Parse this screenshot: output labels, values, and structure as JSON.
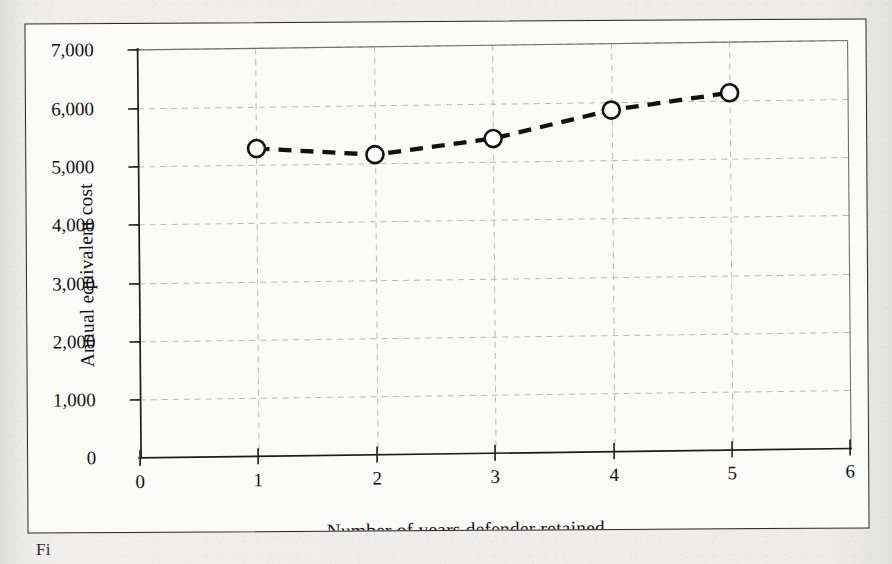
{
  "figure": {
    "background_color": "#ececea",
    "panel_color": "#fbfbfa",
    "border_color": "#2b2b2b",
    "caption": "Fi"
  },
  "chart_data": {
    "type": "line",
    "title": "",
    "subtitle": "",
    "xlabel": "Number of years defender retained",
    "ylabel": "Annual equivalent cost",
    "x": [
      1,
      2,
      3,
      4,
      5
    ],
    "values": [
      5280,
      5150,
      5400,
      5860,
      6130
    ],
    "series": [
      {
        "name": "Annual equivalent cost",
        "x": [
          1,
          2,
          3,
          4,
          5
        ],
        "values": [
          5280,
          5150,
          5400,
          5860,
          6130
        ],
        "line_style": "dashed",
        "line_color": "#111111",
        "marker": "open-circle",
        "marker_fill": "#ffffff",
        "marker_edge": "#111111"
      }
    ],
    "xlim": [
      0,
      6
    ],
    "ylim": [
      0,
      7000
    ],
    "xticks": [
      0,
      1,
      2,
      3,
      4,
      5,
      6
    ],
    "xtick_labels": [
      "0",
      "1",
      "2",
      "3",
      "4",
      "5",
      "6"
    ],
    "yticks": [
      0,
      1000,
      2000,
      3000,
      4000,
      5000,
      6000,
      7000
    ],
    "ytick_labels": [
      "0",
      "1,000",
      "2,000",
      "3,000",
      "4,000",
      "5,000",
      "6,000",
      "7,000"
    ],
    "grid": true,
    "grid_style": "dashed",
    "grid_color": "#b9b9b9",
    "legend": null,
    "legend_position": "none",
    "annotations": []
  }
}
